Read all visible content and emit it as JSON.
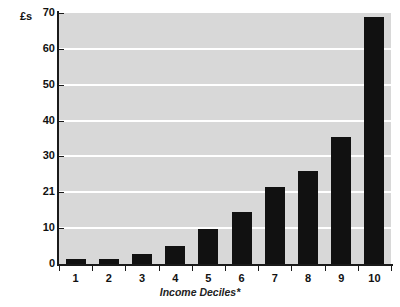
{
  "chart_data": {
    "type": "bar",
    "title": "",
    "xlabel": "Income Deciles*",
    "ylabel": "£s",
    "categories": [
      "1",
      "2",
      "3",
      "4",
      "5",
      "6",
      "7",
      "8",
      "9",
      "10"
    ],
    "values": [
      1.5,
      1.5,
      2.8,
      5.0,
      9.8,
      14.5,
      21.5,
      26.0,
      35.5,
      69.0
    ],
    "ylim": [
      0,
      70
    ],
    "ytick_labels": [
      "70",
      "60",
      "50",
      "40",
      "30",
      "21",
      "10",
      "0"
    ],
    "ytick_values": [
      70,
      60,
      50,
      40,
      30,
      20,
      10,
      0
    ],
    "grid": true,
    "legend": "none",
    "bar_color": "#111111",
    "plot_background": "#d8d8d8",
    "gridline_color": "#ffffff",
    "footnote": "Income Deciles*"
  },
  "axis": {
    "unit_label": "£s",
    "x_title": "Income Deciles*"
  },
  "footer": {
    "cut_caption": ""
  }
}
